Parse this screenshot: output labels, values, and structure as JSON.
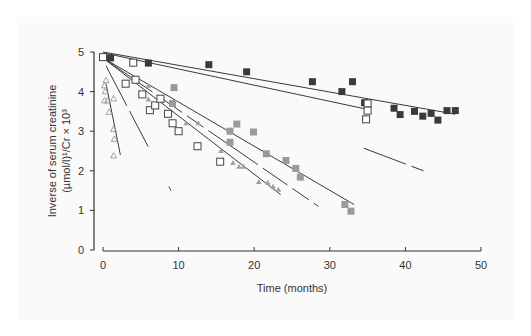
{
  "chart_data": {
    "type": "scatter",
    "title": "",
    "xlabel": "Time (months)",
    "ylabel_line1": "Inverse of serum creatinine",
    "ylabel_line2": "(µmol/l)¹/Cr × 10³",
    "xlim": [
      0,
      50
    ],
    "ylim": [
      0,
      5
    ],
    "xticks": [
      0,
      10,
      20,
      30,
      40,
      50
    ],
    "yticks": [
      0,
      1,
      2,
      3,
      4,
      5
    ],
    "grid": false,
    "legend": "none",
    "series": [
      {
        "name": "dark-filled-squares",
        "marker": "square-filled",
        "color": "#3a3a3a",
        "points": [
          [
            1,
            4.85
          ],
          [
            6,
            4.72
          ],
          [
            14,
            4.68
          ],
          [
            19,
            4.5
          ],
          [
            27.7,
            4.25
          ],
          [
            31.6,
            4.0
          ],
          [
            33,
            4.25
          ],
          [
            34.6,
            3.72
          ],
          [
            38.5,
            3.58
          ],
          [
            39.3,
            3.42
          ],
          [
            41.2,
            3.5
          ],
          [
            42.3,
            3.38
          ],
          [
            43.4,
            3.45
          ],
          [
            44.3,
            3.28
          ],
          [
            45.5,
            3.52
          ],
          [
            46.6,
            3.52
          ]
        ],
        "fit_line": [
          [
            0,
            5.0
          ],
          [
            46.6,
            3.43
          ]
        ]
      },
      {
        "name": "open-squares-slow",
        "marker": "square-open",
        "color": "#444444",
        "points": [
          [
            0,
            4.87
          ],
          [
            4,
            4.73
          ],
          [
            35,
            3.7
          ],
          [
            35,
            3.52
          ],
          [
            34.8,
            3.3
          ]
        ],
        "fit_line": [
          [
            0,
            4.98
          ],
          [
            35,
            3.55
          ]
        ]
      },
      {
        "name": "open-squares-fast",
        "marker": "square-open",
        "color": "#444444",
        "points": [
          [
            3,
            4.2
          ],
          [
            4.3,
            4.3
          ],
          [
            5.2,
            3.93
          ],
          [
            6.2,
            3.53
          ],
          [
            6.9,
            3.65
          ],
          [
            7.6,
            3.82
          ],
          [
            8.6,
            3.44
          ],
          [
            9.2,
            3.2
          ],
          [
            10,
            3.0
          ],
          [
            12.5,
            2.62
          ],
          [
            15.5,
            2.23
          ]
        ],
        "fit_line": [
          [
            0,
            4.85
          ],
          [
            23.5,
            1.4
          ]
        ]
      },
      {
        "name": "gray-filled-squares",
        "marker": "square-filled",
        "color": "#9a9a9a",
        "points": [
          [
            9.4,
            4.1
          ],
          [
            9.2,
            3.7
          ],
          [
            16.8,
            3.0
          ],
          [
            17.7,
            3.18
          ],
          [
            16.8,
            2.72
          ],
          [
            19.9,
            2.98
          ],
          [
            21.6,
            2.43
          ],
          [
            24.2,
            2.26
          ],
          [
            25.5,
            2.06
          ],
          [
            26.1,
            1.84
          ],
          [
            32,
            1.15
          ],
          [
            32.8,
            0.98
          ]
        ],
        "fit_line": [
          [
            0,
            4.85
          ],
          [
            33.2,
            1.15
          ]
        ]
      },
      {
        "name": "gray-filled-triangles",
        "marker": "triangle-filled",
        "color": "#a0a0a0",
        "points": [
          [
            6,
            4.15
          ],
          [
            6,
            3.8
          ],
          [
            11,
            3.2
          ],
          [
            12.6,
            3.2
          ],
          [
            15.6,
            2.5
          ],
          [
            17.2,
            2.2
          ],
          [
            18,
            2.1
          ],
          [
            18.6,
            2.1
          ],
          [
            20.6,
            1.72
          ],
          [
            21.8,
            1.7
          ],
          [
            22.5,
            1.6
          ],
          [
            23.2,
            1.52
          ]
        ],
        "fit_line": [
          [
            0,
            4.85
          ],
          [
            28.5,
            1.1
          ]
        ],
        "fit_line_dashed": true
      },
      {
        "name": "open-triangles",
        "marker": "triangle-open",
        "color": "#999999",
        "points": [
          [
            0.2,
            4.15
          ],
          [
            0.4,
            4.28
          ],
          [
            0.3,
            4.0
          ],
          [
            0.2,
            3.77
          ],
          [
            0.6,
            3.77
          ],
          [
            1.4,
            3.82
          ],
          [
            0.8,
            3.48
          ],
          [
            1.4,
            3.05
          ],
          [
            1.5,
            2.8
          ],
          [
            1.4,
            2.38
          ]
        ],
        "fit_line": [
          [
            0.4,
            4.2
          ],
          [
            2.3,
            2.4
          ]
        ]
      }
    ],
    "extra_lines": [
      {
        "name": "steep-line",
        "from": [
          0.4,
          4.65
        ],
        "to": [
          9.0,
          1.5
        ],
        "dashed": true
      },
      {
        "name": "late-line",
        "from": [
          34.5,
          2.57
        ],
        "to": [
          42.4,
          2.0
        ],
        "dashed": true
      }
    ]
  }
}
